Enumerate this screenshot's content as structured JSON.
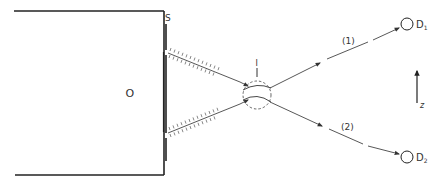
{
  "diagram": {
    "type": "two-slit interference schematic",
    "colors": {
      "ink": "#222222",
      "light_ink": "#555555",
      "background": "#ffffff"
    },
    "labels": {
      "source": "O",
      "screen": "S",
      "interference_region": "I",
      "path_1": "(1)",
      "path_2": "(2)",
      "detector_1_letter": "D",
      "detector_1_sub": "1",
      "detector_2_letter": "D",
      "detector_2_sub": "2",
      "axis": "z"
    },
    "nodes": [
      {
        "id": "source",
        "label": "O",
        "x": 130,
        "y": 93
      },
      {
        "id": "screen",
        "label": "S",
        "x": 166,
        "y": 18
      },
      {
        "id": "interference_region",
        "label": "I",
        "x": 257,
        "y": 95,
        "r": 14
      },
      {
        "id": "detector_1",
        "label": "D1",
        "x": 407,
        "y": 24,
        "r": 6
      },
      {
        "id": "detector_2",
        "label": "D2",
        "x": 407,
        "y": 157,
        "r": 6
      }
    ],
    "edges": [
      {
        "from": "slit_upper",
        "to": "interference_region",
        "style": "hatched beam"
      },
      {
        "from": "slit_lower",
        "to": "interference_region",
        "style": "hatched beam"
      },
      {
        "from": "interference_region",
        "to": "detector_1",
        "label": "(1)",
        "style": "dashed arrow"
      },
      {
        "from": "interference_region",
        "to": "detector_2",
        "label": "(2)",
        "style": "dashed arrow"
      }
    ]
  }
}
